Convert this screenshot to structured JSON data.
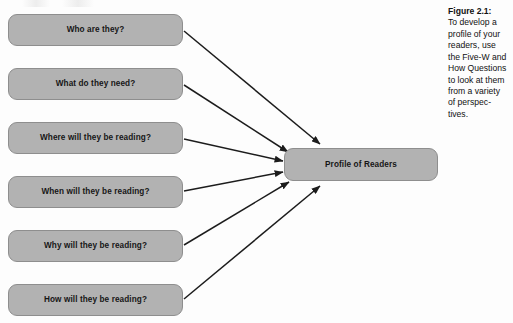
{
  "figure": {
    "nodes": [
      {
        "id": "who",
        "label": "Who are they?",
        "top": 14
      },
      {
        "id": "what",
        "label": "What do they need?",
        "top": 68
      },
      {
        "id": "where",
        "label": "Where will they be reading?",
        "top": 122
      },
      {
        "id": "when",
        "label": "When will they be reading?",
        "top": 176
      },
      {
        "id": "why",
        "label": "Why will they be reading?",
        "top": 230
      },
      {
        "id": "how",
        "label": "How will they be reading?",
        "top": 284
      }
    ],
    "center": {
      "label": "Profile of Readers"
    },
    "arrows": [
      {
        "from": "who",
        "x1": 184,
        "y1": 31,
        "x2": 320,
        "y2": 144
      },
      {
        "from": "what",
        "x1": 184,
        "y1": 85,
        "x2": 288,
        "y2": 152
      },
      {
        "from": "where",
        "x1": 184,
        "y1": 139,
        "x2": 283,
        "y2": 161
      },
      {
        "from": "when",
        "x1": 184,
        "y1": 191,
        "x2": 283,
        "y2": 172
      },
      {
        "from": "why",
        "x1": 184,
        "y1": 245,
        "x2": 289,
        "y2": 182
      },
      {
        "from": "how",
        "x1": 184,
        "y1": 299,
        "x2": 320,
        "y2": 186
      }
    ],
    "caption": {
      "title": "Figure 2.1:",
      "body": "To develop a profile of your readers, use the Five-W and How Questions to look at them from a variety of perspec-tives."
    },
    "colors": {
      "box_fill": "#b2b2b2",
      "box_border": "#8e8e8e",
      "arrow": "#1c1c1c",
      "text": "#161616",
      "background": "#fdfdfd"
    }
  }
}
